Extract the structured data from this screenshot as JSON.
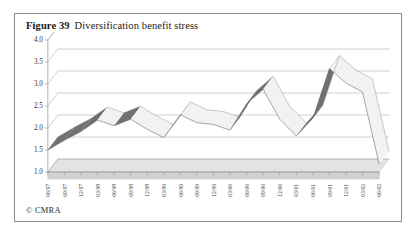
{
  "figure": {
    "number": "Figure 39",
    "title": "Diversification benefit stress",
    "credit": "© CMRA"
  },
  "chart_data": {
    "type": "line",
    "title": "Diversification benefit stress",
    "xlabel": "",
    "ylabel": "",
    "ylim": [
      1.0,
      4.0
    ],
    "ytick_values": [
      1.0,
      1.5,
      2.0,
      2.5,
      3.0,
      3.5,
      4.0
    ],
    "ytick_labels": [
      "1.0",
      "1.5",
      "2.0",
      "2.5",
      "3.0",
      "3.5",
      "4.0"
    ],
    "grid": true,
    "legend": "none",
    "style": "3d-ribbon",
    "categories": [
      "06/97",
      "09/97",
      "12/97",
      "03/98",
      "06/98",
      "09/98",
      "12/98",
      "03/99",
      "06/99",
      "09/99",
      "12/99",
      "03/00",
      "06/00",
      "09/00",
      "12/00",
      "03/01",
      "06/01",
      "09/01",
      "12/01",
      "03/02",
      "06/02"
    ],
    "series": [
      {
        "name": "Diversification benefit",
        "values": [
          1.5,
          1.72,
          1.92,
          2.18,
          2.05,
          2.2,
          1.97,
          1.78,
          2.3,
          2.12,
          2.08,
          1.95,
          2.55,
          2.88,
          2.2,
          1.82,
          2.22,
          3.35,
          3.02,
          2.82,
          1.18
        ]
      }
    ]
  }
}
